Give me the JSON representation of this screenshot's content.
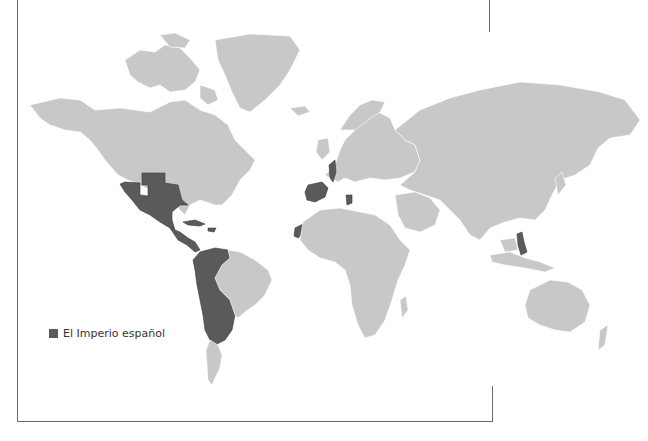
{
  "map": {
    "title": "El Imperio español",
    "colors": {
      "land": "#c8c8c8",
      "empire": "#5a5a5a",
      "background": "#ffffff",
      "frame": "#6b6b6b"
    },
    "highlighted_regions": [
      "Mexico and southwestern North America",
      "Central America",
      "Caribbean islands",
      "Western and southern South America",
      "Spain",
      "Southern Italy",
      "Low Countries",
      "Western Sahara coast",
      "Philippines"
    ]
  },
  "legend": {
    "items": [
      {
        "label": "El Imperio español",
        "color": "#5a5a5a"
      }
    ]
  }
}
